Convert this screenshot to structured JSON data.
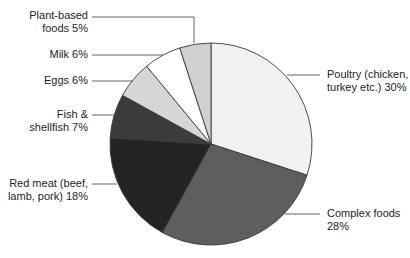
{
  "chart_data": {
    "type": "pie",
    "title": "",
    "start_angle_deg": 0,
    "direction": "clockwise",
    "slices": [
      {
        "label": "Poultry (chicken, turkey etc.)",
        "value": 30,
        "color": "#f1f1f1"
      },
      {
        "label": "Complex foods",
        "value": 28,
        "color": "#5e5e5e"
      },
      {
        "label": "Red meat (beef, lamb, pork)",
        "value": 18,
        "color": "#242424"
      },
      {
        "label": "Fish & shellfish",
        "value": 7,
        "color": "#3b3b3b"
      },
      {
        "label": "Eggs",
        "value": 6,
        "color": "#d6d6d6"
      },
      {
        "label": "Milk",
        "value": 6,
        "color": "#ffffff"
      },
      {
        "label": "Plant-based foods",
        "value": 5,
        "color": "#d0d0d0"
      }
    ],
    "legend": "none (direct labels with leader lines)"
  },
  "labels": {
    "poultry": [
      "Poultry (chicken,",
      "turkey etc.) 30%"
    ],
    "complex": [
      "Complex foods",
      "28%"
    ],
    "redmeat": [
      "Red meat (beef,",
      "lamb, pork) 18%"
    ],
    "fish": [
      "Fish &",
      "shellfish 7%"
    ],
    "eggs": [
      "Eggs 6%"
    ],
    "milk": [
      "Milk 6%"
    ],
    "plant": [
      "Plant-based",
      "foods 5%"
    ]
  }
}
